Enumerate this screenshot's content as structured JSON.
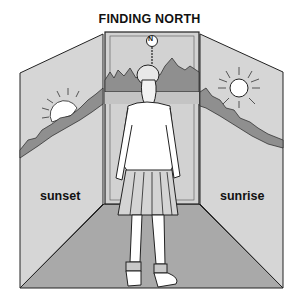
{
  "title": "FINDING NORTH",
  "compass_marker": "N",
  "labels": {
    "left_wall": "sunset",
    "right_wall": "sunrise"
  },
  "colors": {
    "wall": "#d6d6d6",
    "floor": "#a9a9a9",
    "mountains": "#8f8f8f",
    "outline": "#222222"
  },
  "icons": [
    "sun-setting-icon",
    "sun-rising-icon",
    "north-marker-icon",
    "girl-figure-icon"
  ]
}
